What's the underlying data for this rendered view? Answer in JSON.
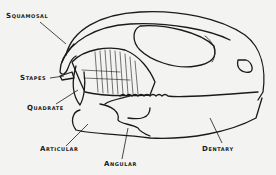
{
  "figure": {
    "colors": {
      "ink": "#1a1a1a",
      "paper": "#f3f3f1"
    },
    "labels": [
      {
        "id": "squamosal",
        "text": "Squamosal",
        "x": 6,
        "y": 13
      },
      {
        "id": "stapes",
        "text": "Stapes",
        "x": 20,
        "y": 75
      },
      {
        "id": "quadrate",
        "text": "Quadrate",
        "x": 27,
        "y": 105
      },
      {
        "id": "articular",
        "text": "Articular",
        "x": 40,
        "y": 146
      },
      {
        "id": "angular",
        "text": "Angular",
        "x": 104,
        "y": 161
      },
      {
        "id": "dentary",
        "text": "Dentary",
        "x": 202,
        "y": 146
      }
    ]
  }
}
